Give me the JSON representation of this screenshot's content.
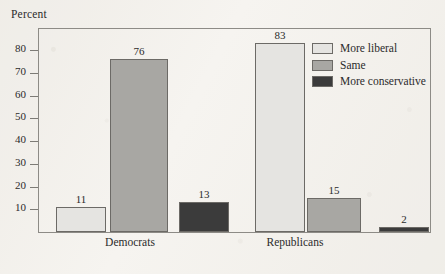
{
  "axis_title": "Percent",
  "legend": {
    "items": [
      {
        "label": "More liberal",
        "color": "#e5e4e1",
        "key": "more-liberal"
      },
      {
        "label": "Same",
        "color": "#a8a7a3",
        "key": "same"
      },
      {
        "label": "More conservative",
        "color": "#3b3b3b",
        "key": "more-conservative"
      }
    ]
  },
  "chart_data": {
    "type": "bar",
    "title": "",
    "xlabel": "",
    "ylabel": "Percent",
    "ylim": [
      0,
      90
    ],
    "ytick_values": [
      10,
      20,
      30,
      40,
      50,
      60,
      70,
      80
    ],
    "ytick_labels": [
      "10",
      "20",
      "30",
      "40",
      "50",
      "60",
      "70",
      "80"
    ],
    "grid": false,
    "legend_position": "top-right",
    "categories": [
      "Democrats",
      "Republicans"
    ],
    "series": [
      {
        "name": "More liberal",
        "color": "#e5e4e1",
        "values": [
          11,
          83
        ]
      },
      {
        "name": "Same",
        "color": "#a8a7a3",
        "values": [
          76,
          15
        ]
      },
      {
        "name": "More conservative",
        "color": "#3b3b3b",
        "values": [
          13,
          2
        ]
      }
    ],
    "bars": [
      {
        "group": "Democrats",
        "series": "More liberal",
        "value": 11,
        "label": "11",
        "color": "#e5e4e1"
      },
      {
        "group": "Democrats",
        "series": "Same",
        "value": 76,
        "label": "76",
        "color": "#a8a7a3"
      },
      {
        "group": "Democrats",
        "series": "More conservative",
        "value": 13,
        "label": "13",
        "color": "#3b3b3b"
      },
      {
        "group": "Republicans",
        "series": "More liberal",
        "value": 83,
        "label": "83",
        "color": "#e5e4e1"
      },
      {
        "group": "Republicans",
        "series": "Same",
        "value": 15,
        "label": "15",
        "color": "#a8a7a3"
      },
      {
        "group": "Republicans",
        "series": "More conservative",
        "value": 2,
        "label": "2",
        "color": "#3b3b3b"
      }
    ]
  },
  "layout": {
    "bar_geometry": [
      {
        "left": 17,
        "width": 50
      },
      {
        "left": 71,
        "width": 58
      },
      {
        "left": 140,
        "width": 50
      },
      {
        "left": 216,
        "width": 50
      },
      {
        "left": 268,
        "width": 54
      },
      {
        "left": 340,
        "width": 50
      }
    ],
    "group_label_x": [
      130,
      295
    ]
  }
}
